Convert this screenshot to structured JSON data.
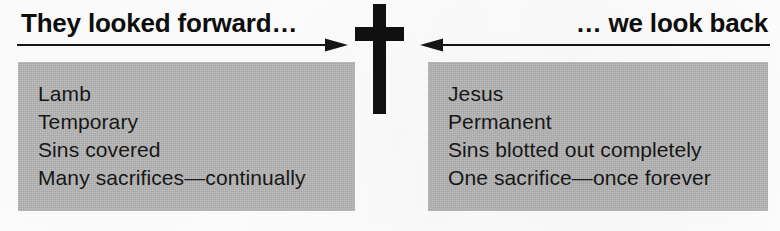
{
  "figure": {
    "kind": "comparison-diagram",
    "center_symbol": "cross-icon",
    "panel_fill_color": "#b9b9b9",
    "ink_color": "#101010",
    "background_color": "#fefefe"
  },
  "headings": {
    "left": "They looked forward…",
    "right": "… we look back"
  },
  "arrows": {
    "left": {
      "name": "arrow-right-icon",
      "direction": "right",
      "label": "They looked forward…"
    },
    "right": {
      "name": "arrow-left-icon",
      "direction": "left",
      "label": "… we look back"
    }
  },
  "panels": [
    {
      "side": "left",
      "title": "They looked forward…",
      "lines": [
        "Lamb",
        "Temporary",
        "Sins covered",
        "Many sacrifices—continually"
      ]
    },
    {
      "side": "right",
      "title": "… we look back",
      "lines": [
        "Jesus",
        "Permanent",
        "Sins blotted out completely",
        "One sacrifice—once forever"
      ]
    }
  ]
}
